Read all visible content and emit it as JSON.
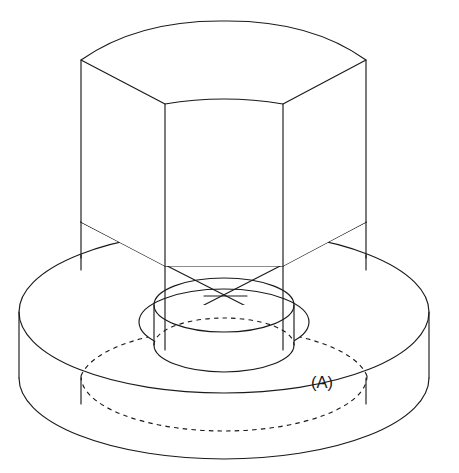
{
  "figure": {
    "type": "technical-line-drawing",
    "projection": "isometric",
    "background_color": "#ffffff",
    "line_color": "#1a1a1a",
    "visible_line_style": "solid",
    "hidden_line_style": "dashed"
  },
  "annotations": {
    "callout_a": {
      "label": "(A)",
      "x": 313,
      "y": 383,
      "points_to": "hidden-bore-circle-on-flange-underside"
    }
  },
  "geometry": {
    "hex_prism": {
      "name": "hexagonal-head",
      "center_x": 224,
      "top_center_y": 63,
      "bottom_center_y": 225,
      "half_width": 143,
      "ellipse_ry": 41,
      "height": 162,
      "visible_vertices_top": [
        [
          81,
          60
        ],
        [
          165,
          104
        ],
        [
          283,
          104
        ],
        [
          366,
          60
        ],
        [
          307,
          24
        ],
        [
          141,
          24
        ]
      ],
      "visible_vertices_bottom": [
        [
          81,
          222
        ],
        [
          165,
          266
        ],
        [
          283,
          266
        ],
        [
          366,
          222
        ]
      ],
      "vertical_edges_x": [
        81,
        165,
        283,
        366
      ]
    },
    "flange": {
      "name": "circular-flange-base",
      "center_x": 224,
      "top_center_y": 312,
      "rx": 205,
      "ry": 81,
      "thickness": 66,
      "left_edge_x": 19,
      "right_edge_x": 429,
      "top_ellipse_cy": 312,
      "bottom_ellipse_cy": 378
    },
    "boss": {
      "name": "center-cylindrical-boss",
      "center_x": 224,
      "top_ellipse_cy": 305,
      "bottom_ellipse_cy": 345,
      "rx": 70,
      "ry": 27,
      "height": 40
    },
    "bore_circle": {
      "name": "hexagon-inscribed-circle",
      "center_x": 224,
      "cy": 322,
      "rx": 85,
      "ry": 33
    },
    "hidden_bore": {
      "name": "hidden-bore-on-flange",
      "center_x": 224,
      "cy": 376,
      "rx": 143,
      "ry": 55
    }
  },
  "element_names": {
    "hex_top_face": "hexagon-top-face",
    "hex_side_left": "hexagon-left-face",
    "hex_side_front": "hexagon-front-face",
    "hex_side_right": "hexagon-right-face",
    "flange_outer": "flange-outer-cylinder",
    "flange_top": "flange-top-surface",
    "boss_cylinder": "center-boss-cylinder"
  }
}
